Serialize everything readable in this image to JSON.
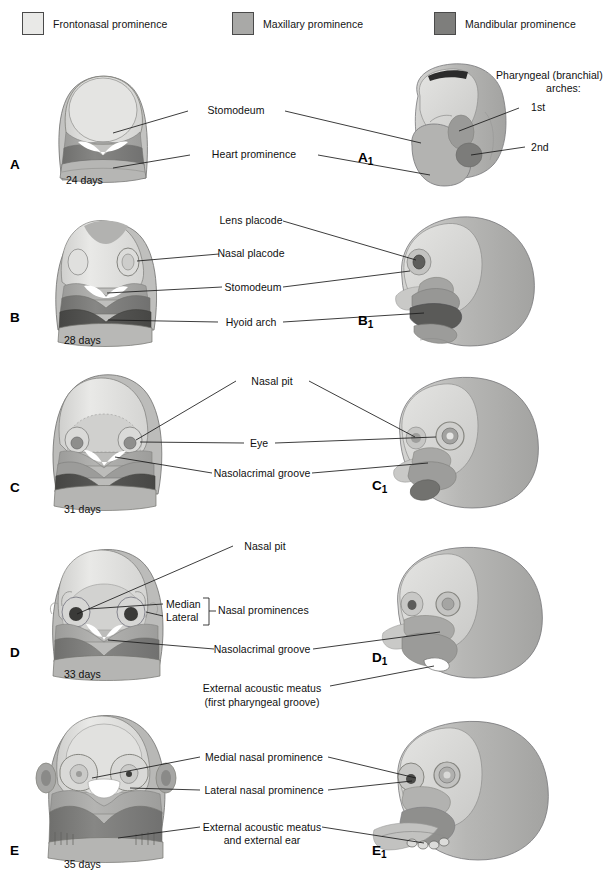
{
  "figure": {
    "colors": {
      "frontonasal": "#e2e2e0",
      "maxillary": "#a9a9a7",
      "mandibular": "#7e7e7c",
      "hyoid": "#4f4f4d",
      "outline": "#6a6a68",
      "leader": "#1a1a1a",
      "background": "#ffffff"
    }
  },
  "legend": {
    "items": [
      {
        "label": "Frontonasal prominence",
        "swatch": "#e9e9e7",
        "x": 22,
        "y": 14
      },
      {
        "label": "Maxillary prominence",
        "swatch": "#a9a9a7",
        "x": 232,
        "y": 14
      },
      {
        "label": "Mandibular prominence",
        "swatch": "#7e7e7c",
        "x": 434,
        "y": 14
      }
    ]
  },
  "panels": [
    {
      "id": "A",
      "letter": "A",
      "letter_sub": "",
      "lateral_letter": "A",
      "lateral_letter_sub": "1",
      "age": "24 days",
      "labels": [
        {
          "name": "stomodeum",
          "text": "Stomodeum"
        },
        {
          "name": "heart-prominence",
          "text": "Heart prominence"
        },
        {
          "name": "pharyngeal-arches-title-1",
          "text": "Pharyngeal (branchial)"
        },
        {
          "name": "pharyngeal-arches-title-2",
          "text": "arches:"
        },
        {
          "name": "arch-first",
          "text": "1st"
        },
        {
          "name": "arch-second",
          "text": "2nd"
        }
      ]
    },
    {
      "id": "B",
      "letter": "B",
      "letter_sub": "",
      "lateral_letter": "B",
      "lateral_letter_sub": "1",
      "age": "28 days",
      "labels": [
        {
          "name": "lens-placode",
          "text": "Lens placode"
        },
        {
          "name": "nasal-placode",
          "text": "Nasal placode"
        },
        {
          "name": "stomodeum",
          "text": "Stomodeum"
        },
        {
          "name": "hyoid-arch",
          "text": "Hyoid arch"
        }
      ]
    },
    {
      "id": "C",
      "letter": "C",
      "letter_sub": "",
      "lateral_letter": "C",
      "lateral_letter_sub": "1",
      "age": "31 days",
      "labels": [
        {
          "name": "nasal-pit",
          "text": "Nasal pit"
        },
        {
          "name": "eye",
          "text": "Eye"
        },
        {
          "name": "nasolacrimal-groove",
          "text": "Nasolacrimal groove"
        }
      ]
    },
    {
      "id": "D",
      "letter": "D",
      "letter_sub": "",
      "lateral_letter": "D",
      "lateral_letter_sub": "1",
      "age": "33 days",
      "labels": [
        {
          "name": "nasal-pit",
          "text": "Nasal pit"
        },
        {
          "name": "median",
          "text": "Median"
        },
        {
          "name": "lateral",
          "text": "Lateral"
        },
        {
          "name": "nasal-prominences",
          "text": "Nasal prominences"
        },
        {
          "name": "nasolacrimal-groove",
          "text": "Nasolacrimal groove"
        },
        {
          "name": "external-acoustic-meatus-1",
          "text": "External acoustic meatus"
        },
        {
          "name": "external-acoustic-meatus-2",
          "text": "(first pharyngeal groove)"
        }
      ]
    },
    {
      "id": "E",
      "letter": "E",
      "letter_sub": "",
      "lateral_letter": "E",
      "lateral_letter_sub": "1",
      "age": "35 days",
      "labels": [
        {
          "name": "medial-nasal-prominence",
          "text": "Medial nasal prominence"
        },
        {
          "name": "lateral-nasal-prominence",
          "text": "Lateral nasal prominence"
        },
        {
          "name": "external-acoustic-meatus-1",
          "text": "External acoustic meatus"
        },
        {
          "name": "external-acoustic-meatus-2",
          "text": "and external ear"
        }
      ]
    }
  ]
}
